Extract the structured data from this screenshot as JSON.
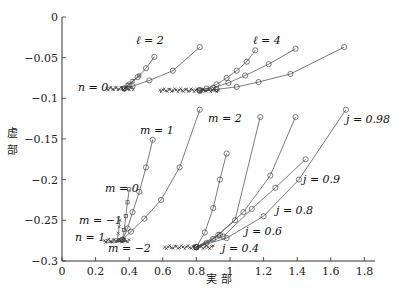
{
  "chart_data": {
    "type": "line",
    "title": "",
    "xlabel": "実 部",
    "ylabel": "虚 部",
    "xlim": [
      0,
      1.85
    ],
    "ylim": [
      -0.3,
      0
    ],
    "x_ticks": [
      0,
      0.2,
      0.4,
      0.6,
      0.8,
      1,
      1.2,
      1.4,
      1.6,
      1.8
    ],
    "x_tick_labels": [
      "0",
      "0.2",
      "0.4",
      "0.6",
      "0.8",
      "1",
      "1.2",
      "1.4",
      "1.6",
      "1.8"
    ],
    "y_ticks": [
      0,
      -0.05,
      -0.1,
      -0.15,
      -0.2,
      -0.25,
      -0.3
    ],
    "y_tick_labels": [
      "0",
      "−0.05",
      "−0.1",
      "−0.15",
      "−0.2",
      "−0.25",
      "−0.3"
    ],
    "grid": false,
    "legend": "none (inline annotations)",
    "annotations": [
      {
        "text": "ℓ = 2",
        "x": 0.44,
        "y": -0.025
      },
      {
        "text": "ℓ = 4",
        "x": 0.95,
        "y": -0.025
      },
      {
        "text": "n = 0",
        "x": 0.13,
        "y": -0.087
      },
      {
        "text": "m = 1",
        "x": 0.4,
        "y": -0.13
      },
      {
        "text": "m = 2",
        "x": 0.85,
        "y": -0.12
      },
      {
        "text": "m = 0",
        "x": 0.26,
        "y": -0.21
      },
      {
        "text": "m = −1",
        "x": 0.2,
        "y": -0.247
      },
      {
        "text": "n = 1",
        "x": 0.16,
        "y": -0.266
      },
      {
        "text": "m = −2",
        "x": 0.3,
        "y": -0.284
      },
      {
        "text": "j = 0.98",
        "x": 1.72,
        "y": -0.118
      },
      {
        "text": "j = 0.9",
        "x": 1.45,
        "y": -0.178
      },
      {
        "text": "j = 0.8",
        "x": 1.3,
        "y": -0.213
      },
      {
        "text": "j = 0.6",
        "x": 1.1,
        "y": -0.24
      },
      {
        "text": "j = 0.4",
        "x": 0.96,
        "y": -0.265
      }
    ],
    "series": [
      {
        "name": "ℓ=2 branch a (n=0)",
        "x": [
          0.37,
          0.4,
          0.45,
          0.5,
          0.55
        ],
        "y": [
          -0.088,
          -0.083,
          -0.074,
          -0.063,
          -0.049
        ],
        "marker": "circle"
      },
      {
        "name": "ℓ=2 branch b (n=0)",
        "x": [
          0.37,
          0.42,
          0.52,
          0.66,
          0.82
        ],
        "y": [
          -0.088,
          -0.085,
          -0.078,
          -0.066,
          -0.037
        ],
        "marker": "circle"
      },
      {
        "name": "ℓ=2 branch c (n=0)",
        "x": [
          0.37,
          0.39,
          0.42,
          0.46
        ],
        "y": [
          -0.088,
          -0.084,
          -0.079,
          -0.072
        ],
        "marker": "square"
      },
      {
        "name": "ℓ=4 j=0.6",
        "x": [
          0.82,
          0.86,
          0.92,
          0.98,
          1.04,
          1.1,
          1.15
        ],
        "y": [
          -0.09,
          -0.088,
          -0.083,
          -0.075,
          -0.066,
          -0.055,
          -0.041
        ],
        "marker": "circle"
      },
      {
        "name": "ℓ=4 j=0.9",
        "x": [
          0.82,
          0.9,
          0.99,
          1.09,
          1.23,
          1.39
        ],
        "y": [
          -0.09,
          -0.087,
          -0.081,
          -0.072,
          -0.058,
          -0.039
        ],
        "marker": "circle"
      },
      {
        "name": "ℓ=4 j=0.98",
        "x": [
          0.82,
          0.92,
          1.04,
          1.17,
          1.36,
          1.68
        ],
        "y": [
          -0.091,
          -0.089,
          -0.086,
          -0.08,
          -0.07,
          -0.037
        ],
        "marker": "circle"
      },
      {
        "name": "m=1 (n=1)",
        "x": [
          0.36,
          0.39,
          0.42,
          0.46,
          0.5,
          0.54
        ],
        "y": [
          -0.274,
          -0.26,
          -0.24,
          -0.215,
          -0.185,
          -0.151
        ],
        "marker": "circle"
      },
      {
        "name": "m=2 (n=1)",
        "x": [
          0.36,
          0.41,
          0.49,
          0.59,
          0.7,
          0.82
        ],
        "y": [
          -0.274,
          -0.264,
          -0.248,
          -0.225,
          -0.185,
          -0.114
        ],
        "marker": "circle"
      },
      {
        "name": "m=0 (n=1)",
        "x": [
          0.36,
          0.37,
          0.38,
          0.39,
          0.4
        ],
        "y": [
          -0.274,
          -0.262,
          -0.245,
          -0.228,
          -0.212
        ],
        "marker": "square"
      },
      {
        "name": "m=-1 (n=1)",
        "x": [
          0.33,
          0.335,
          0.34,
          0.345
        ],
        "y": [
          -0.274,
          -0.266,
          -0.258,
          -0.25
        ],
        "marker": "x"
      },
      {
        "name": "m=-2 (n=1)",
        "x": [
          0.26,
          0.3,
          0.34,
          0.36
        ],
        "y": [
          -0.277,
          -0.277,
          -0.276,
          -0.274
        ],
        "marker": "x"
      },
      {
        "name": "n=1 m=1 j-sweep",
        "x": [
          0.8,
          0.85,
          0.9,
          0.94,
          0.98
        ],
        "y": [
          -0.283,
          -0.265,
          -0.235,
          -0.2,
          -0.168
        ],
        "marker": "circle"
      },
      {
        "name": "n=1 j=0.4",
        "x": [
          0.8,
          0.86,
          0.94
        ],
        "y": [
          -0.283,
          -0.278,
          -0.268
        ],
        "marker": "circle"
      },
      {
        "name": "n=1 j=0.6",
        "x": [
          0.8,
          0.9,
          1.03,
          1.18
        ],
        "y": [
          -0.283,
          -0.273,
          -0.25,
          -0.123
        ],
        "marker": "circle"
      },
      {
        "name": "n=1 j=0.8",
        "x": [
          0.8,
          0.93,
          1.08,
          1.24,
          1.39
        ],
        "y": [
          -0.283,
          -0.268,
          -0.24,
          -0.195,
          -0.123
        ],
        "marker": "circle"
      },
      {
        "name": "n=1 j=0.9",
        "x": [
          0.8,
          0.96,
          1.13,
          1.27,
          1.45
        ],
        "y": [
          -0.283,
          -0.27,
          -0.236,
          -0.21,
          -0.175
        ],
        "marker": "circle"
      },
      {
        "name": "n=1 j=0.98",
        "x": [
          0.8,
          0.98,
          1.2,
          1.41,
          1.69
        ],
        "y": [
          -0.283,
          -0.272,
          -0.245,
          -0.2,
          -0.114
        ],
        "marker": "circle"
      }
    ]
  },
  "axes": {
    "xlabel": "実 部",
    "ylabel_top": "虚",
    "ylabel_bottom": "部"
  },
  "labels": {
    "l2": "ℓ = 2",
    "l4": "ℓ = 4",
    "n0": "n = 0",
    "m1": "m = 1",
    "m2": "m = 2",
    "m0": "m = 0",
    "mm1": "m = −1",
    "n1": "n = 1",
    "mm2": "m = −2",
    "j098": "j = 0.98",
    "j09": "j = 0.9",
    "j08": "j = 0.8",
    "j06": "j = 0.6",
    "j04": "j = 0.4"
  }
}
